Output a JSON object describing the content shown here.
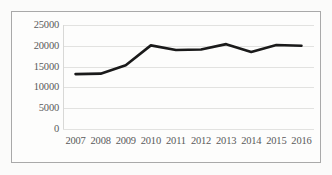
{
  "chart_data": {
    "type": "line",
    "title": "",
    "subtitle": "",
    "xlabel": "",
    "ylabel": "",
    "categories": [
      "2007",
      "2008",
      "2009",
      "2010",
      "2011",
      "2012",
      "2013",
      "2014",
      "2015",
      "2016"
    ],
    "series": [
      {
        "name": "",
        "values": [
          13200,
          13300,
          15300,
          20100,
          19000,
          19100,
          20400,
          18500,
          20200,
          20000
        ],
        "color": "#1a1a1a",
        "line_width": 2.6
      }
    ],
    "ylim": [
      0,
      25000
    ],
    "yticks": [
      0,
      5000,
      10000,
      15000,
      20000,
      25000
    ],
    "ytick_labels": [
      "0",
      "5000",
      "10000",
      "15000",
      "20000",
      "25000"
    ],
    "xtick_labels": [
      "2007",
      "2008",
      "2009",
      "2010",
      "2011",
      "2012",
      "2013",
      "2014",
      "2015",
      "2016"
    ],
    "grid": true,
    "grid_axis": "y",
    "grid_color": "#e2e2e0",
    "legend": false,
    "legend_position": "none",
    "border_color": "#a9a9a9",
    "background_color": "#fdfdfc",
    "tick_label_color": "#59595a",
    "annotations": []
  }
}
